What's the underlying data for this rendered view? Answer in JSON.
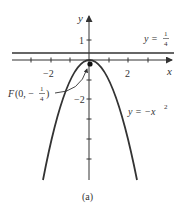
{
  "figure": {
    "caption": "(a)",
    "axes": {
      "x_label": "x",
      "y_label": "y",
      "x_tick_labels": [
        "−2",
        "2"
      ],
      "y_tick_labels": [
        "1",
        "−2"
      ]
    },
    "curves": {
      "parabola_label_prefix": "y = −x",
      "parabola_label_exp": "2",
      "directrix_label_prefix": "y = ",
      "directrix_num": "1",
      "directrix_den": "4"
    },
    "focus": {
      "label_prefix": "F(0, −",
      "num": "1",
      "den": "4",
      "label_suffix": ")"
    },
    "colors": {
      "line": "#333333",
      "background": "#ffffff"
    }
  }
}
